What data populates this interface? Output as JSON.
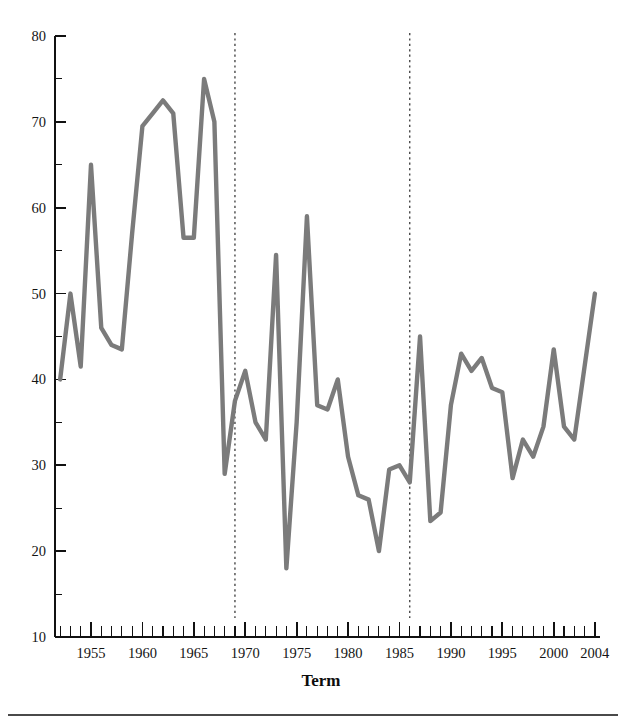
{
  "figure": {
    "background_color": "#ffffff",
    "line_color": "#7b7b7b",
    "axis_color": "#111111",
    "event_line_color": "#2b2b2b"
  },
  "axes": {
    "x_title": "Term",
    "y_tick_labels": [
      "80",
      "70",
      "60",
      "50",
      "40",
      "30",
      "20",
      "10"
    ],
    "x_tick_labels": [
      "1955",
      "1960",
      "1965",
      "1970",
      "1975",
      "1980",
      "1985",
      "1990",
      "1995",
      "2000",
      "2004"
    ]
  },
  "chart_data": {
    "type": "line",
    "title": "",
    "xlabel": "Term",
    "ylabel": "",
    "xlim": [
      1951.5,
      2004.5
    ],
    "ylim": [
      10,
      80
    ],
    "y_major_ticks": [
      10,
      20,
      30,
      40,
      50,
      60,
      70,
      80
    ],
    "y_minor_ticks": [
      15,
      25,
      35,
      45,
      55,
      65,
      75
    ],
    "x_major_ticks": [
      1955,
      1960,
      1965,
      1970,
      1975,
      1980,
      1985,
      1990,
      1995,
      2000,
      2004
    ],
    "x_tick_interval": 1,
    "grid": false,
    "legend": "none",
    "series": [
      {
        "name": "value",
        "x": [
          1952,
          1953,
          1954,
          1955,
          1956,
          1957,
          1958,
          1959,
          1960,
          1961,
          1962,
          1963,
          1964,
          1965,
          1966,
          1967,
          1968,
          1969,
          1970,
          1971,
          1972,
          1973,
          1974,
          1975,
          1976,
          1977,
          1978,
          1979,
          1980,
          1981,
          1982,
          1983,
          1984,
          1985,
          1986,
          1987,
          1988,
          1989,
          1990,
          1991,
          1992,
          1993,
          1994,
          1995,
          1996,
          1997,
          1998,
          1999,
          2000,
          2001,
          2002,
          2003,
          2004
        ],
        "values": [
          40.0,
          50.0,
          41.5,
          65.0,
          46.0,
          44.0,
          43.5,
          57.0,
          69.5,
          71.0,
          72.5,
          71.0,
          56.5,
          56.5,
          75.0,
          70.0,
          29.0,
          37.5,
          41.0,
          35.0,
          33.0,
          54.5,
          18.0,
          35.0,
          59.0,
          37.0,
          36.5,
          40.0,
          31.0,
          26.5,
          26.0,
          20.0,
          29.5,
          30.0,
          28.0,
          45.0,
          23.5,
          24.5,
          37.0,
          43.0,
          41.0,
          42.5,
          39.0,
          38.5,
          28.5,
          33.0,
          31.0,
          34.5,
          43.5,
          34.5,
          33.0,
          41.5,
          50.0
        ]
      }
    ],
    "annotations": [
      {
        "type": "vertical-dashed-line",
        "x": 1969,
        "label": ""
      },
      {
        "type": "vertical-dashed-line",
        "x": 1986,
        "label": ""
      }
    ]
  }
}
